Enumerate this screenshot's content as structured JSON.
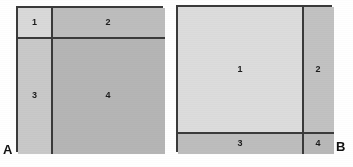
{
  "figure": {
    "width": 353,
    "height": 167,
    "background": "#ffffff",
    "line_color": "#3a3a3a",
    "label_color": "#1c1c1c",
    "caption_color": "#111111"
  },
  "panels": [
    {
      "caption": "A",
      "frame": {
        "x": 16,
        "y": 6,
        "w": 147,
        "h": 146
      },
      "dividers": {
        "vertical_x": 49,
        "horizontal_y": 35
      },
      "cells": [
        {
          "label": "1",
          "color": "#d9d9d9",
          "x": 16,
          "y": 6,
          "w": 33,
          "h": 29
        },
        {
          "label": "2",
          "color": "#bdbdbd",
          "x": 49,
          "y": 6,
          "w": 114,
          "h": 29
        },
        {
          "label": "3",
          "color": "#c9c9c9",
          "x": 16,
          "y": 35,
          "w": 33,
          "h": 117
        },
        {
          "label": "4",
          "color": "#b5b5b5",
          "x": 49,
          "y": 35,
          "w": 114,
          "h": 117
        }
      ],
      "caption_position": {
        "x": 3,
        "y": 143
      }
    },
    {
      "caption": "B",
      "frame": {
        "x": 176,
        "y": 5,
        "w": 156,
        "h": 147
      },
      "dividers": {
        "vertical_x": 300,
        "horizontal_y": 130
      },
      "cells": [
        {
          "label": "1",
          "color": "#dcdcdc",
          "x": 176,
          "y": 5,
          "w": 124,
          "h": 125
        },
        {
          "label": "2",
          "color": "#c2c2c2",
          "x": 300,
          "y": 5,
          "w": 32,
          "h": 125
        },
        {
          "label": "3",
          "color": "#bdbdbd",
          "x": 176,
          "y": 130,
          "w": 124,
          "h": 22
        },
        {
          "label": "4",
          "color": "#b8b8b8",
          "x": 300,
          "y": 130,
          "w": 32,
          "h": 22
        }
      ],
      "caption_position": {
        "x": 336,
        "y": 140
      }
    }
  ]
}
